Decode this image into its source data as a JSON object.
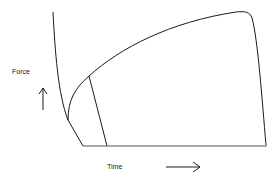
{
  "diagram": {
    "y_axis_label": "Force",
    "x_axis_label": "Time",
    "y_arrow_icon": "up-arrow-icon",
    "x_arrow_icon": "right-arrow-icon",
    "line_color": "#1a1a1a",
    "baseline_color": "#555555"
  }
}
